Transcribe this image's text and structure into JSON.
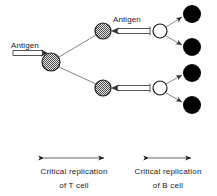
{
  "figure": {
    "background_color": "#ffffff",
    "width": 217,
    "height": 196
  },
  "labels": {
    "antigen_left": "Antigen",
    "antigen_upper": "Antigen"
  },
  "captions": {
    "left": {
      "line1": "Critical replication",
      "line2": "of T  cell",
      "span_start_x": 38,
      "span_end_x": 110
    },
    "right": {
      "line1": "Critical replication",
      "line2": "of B  cell",
      "span_start_x": 143,
      "span_end_x": 197
    }
  },
  "colors": {
    "stroke": "#1a1a1a",
    "line": "#555555",
    "filled_cell": "#000000",
    "open_cell": "#ffffff",
    "hatched_cell_base": "#d9d9d9",
    "hatched_cell_dark": "#4d4d4d"
  },
  "nodes": {
    "hatched_cells": [
      {
        "name": "t-cell-precursor",
        "cx": 51,
        "cy": 62,
        "r": 9
      },
      {
        "name": "t-cell-upper",
        "cx": 103,
        "cy": 31,
        "r": 8
      },
      {
        "name": "t-cell-lower",
        "cx": 103,
        "cy": 88,
        "r": 8
      }
    ],
    "open_cells": [
      {
        "name": "b-cell-upper",
        "cx": 160,
        "cy": 31,
        "r": 7
      },
      {
        "name": "b-cell-lower",
        "cx": 160,
        "cy": 88,
        "r": 7
      }
    ],
    "filled_cells": [
      {
        "name": "plasma-cell-1",
        "cx": 192,
        "cy": 14,
        "r": 9
      },
      {
        "name": "plasma-cell-2",
        "cx": 192,
        "cy": 47,
        "r": 9
      },
      {
        "name": "plasma-cell-3",
        "cx": 192,
        "cy": 73,
        "r": 9
      },
      {
        "name": "plasma-cell-4",
        "cx": 192,
        "cy": 105,
        "r": 9
      }
    ]
  }
}
